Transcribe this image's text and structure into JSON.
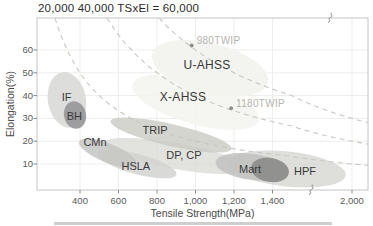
{
  "chart_data": {
    "type": "scatter",
    "title": "20,000 40,000 TSxEl = 60,000",
    "xlabel": "Tensile Strength(MPa)",
    "ylabel": "Elongation(%)",
    "x_ticks": [
      {
        "value": 400,
        "label": "400"
      },
      {
        "value": 600,
        "label": "600"
      },
      {
        "value": 800,
        "label": "800"
      },
      {
        "value": 1000,
        "label": "1,000"
      },
      {
        "value": 1200,
        "label": "1,200"
      },
      {
        "value": 1400,
        "label": "1,400"
      },
      {
        "value": 2000,
        "label": "2,000"
      }
    ],
    "y_ticks": [
      {
        "value": 10,
        "label": "10"
      },
      {
        "value": 20,
        "label": "20"
      },
      {
        "value": 30,
        "label": "30"
      },
      {
        "value": 40,
        "label": "40"
      },
      {
        "value": 50,
        "label": "50"
      },
      {
        "value": 60,
        "label": "60"
      }
    ],
    "axis_break": {
      "axis": "x",
      "between": [
        1400,
        2000
      ]
    },
    "grid": true,
    "iso_curves": {
      "formula": "TSxEl",
      "products": [
        20000,
        40000,
        60000
      ],
      "style": "dashed"
    },
    "regions": [
      {
        "name": "zone-u-ahss",
        "label": null,
        "ts": 1075,
        "el": 52,
        "ts_r": 310,
        "el_r": 11,
        "rot": 14,
        "fill": "#f2f2ee",
        "opacity": 0.95
      },
      {
        "name": "zone-x-ahss",
        "label": null,
        "ts": 1000,
        "el": 37,
        "ts_r": 340,
        "el_r": 9.5,
        "rot": 16,
        "fill": "#f3f3ef",
        "opacity": 0.85
      },
      {
        "name": "hpf",
        "label": "HPF",
        "ts": 1560,
        "el": 7.8,
        "ts_r": 390,
        "el_r": 7.7,
        "rot": 6,
        "fill": "#d6d6d2",
        "opacity": 0.8,
        "label_ts": 1610,
        "label_el": 6.9
      },
      {
        "name": "dp-cp",
        "label": "DP, CP",
        "ts": 894,
        "el": 13.5,
        "ts_r": 379,
        "el_r": 5.7,
        "rot": 10,
        "fill": "#d8d8d4",
        "opacity": 0.75,
        "label_ts": 940,
        "label_el": 13.9
      },
      {
        "name": "trip",
        "label": "TRIP",
        "ts": 873,
        "el": 22.7,
        "ts_r": 322,
        "el_r": 4.8,
        "rot": 13,
        "fill": "#c9cbc3",
        "opacity": 0.8,
        "label_ts": 790,
        "label_el": 24.9
      },
      {
        "name": "hsla",
        "label": "HSLA",
        "ts": 696,
        "el": 10,
        "ts_r": 213,
        "el_r": 4.4,
        "rot": 15,
        "fill": "#d2d2d0",
        "opacity": 0.85,
        "label_ts": 690,
        "label_el": 9
      },
      {
        "name": "cmn",
        "label": "CMn",
        "ts": 545,
        "el": 14.8,
        "ts_r": 161,
        "el_r": 4.2,
        "rot": 22,
        "fill": "#c5c5c3",
        "opacity": 0.85,
        "label_ts": 478,
        "label_el": 19.6
      },
      {
        "name": "mart",
        "label": "Mart",
        "ts": 1294,
        "el": 8.7,
        "ts_r": 192,
        "el_r": 5.7,
        "rot": 8,
        "fill": "#c1c1bf",
        "opacity": 0.85,
        "label_ts": 1283,
        "label_el": 7.8
      },
      {
        "name": "mart-core",
        "label": null,
        "ts": 1387,
        "el": 7.4,
        "ts_r": 99,
        "el_r": 5.3,
        "rot": 10,
        "fill": "#8c8c8a",
        "opacity": 0.92
      },
      {
        "name": "if",
        "label": "IF",
        "ts": 332,
        "el": 38.1,
        "ts_r": 99,
        "el_r": 12.3,
        "rot": -10,
        "fill": "#d9d9d7",
        "opacity": 0.9,
        "label_ts": 330,
        "label_el": 39.5
      },
      {
        "name": "bh",
        "label": "BH",
        "ts": 374,
        "el": 31.5,
        "ts_r": 57,
        "el_r": 6.1,
        "rot": -12,
        "fill": "#97979a",
        "opacity": 0.92,
        "label_ts": 371,
        "label_el": 31
      }
    ],
    "zone_labels": [
      {
        "label": "U-AHSS",
        "ts": 1060,
        "el": 53.4
      },
      {
        "label": "X-AHSS",
        "ts": 935,
        "el": 39.4
      }
    ],
    "points": [
      {
        "label": "980TWIP",
        "ts": 980,
        "el": 62
      },
      {
        "label": "1180TWIP",
        "ts": 1185,
        "el": 34.5
      }
    ],
    "colors": {
      "frame": "#c4c4c4",
      "grid": "#ededeb",
      "iso_curve": "#c8c8c2",
      "tick": "#8a8a8a",
      "point_dot": "#8f8f8f",
      "point_label": "#b4b4ae",
      "region_label": "#3a3a3a",
      "break_mark": "#7d7d7d"
    }
  }
}
